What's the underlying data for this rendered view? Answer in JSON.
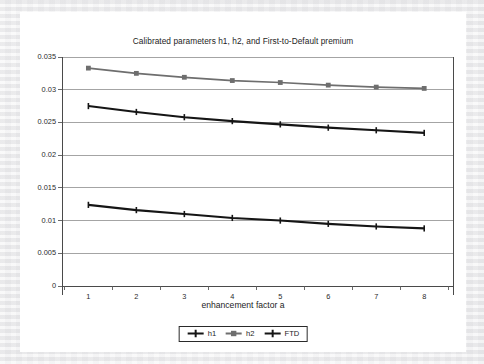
{
  "chart_data": {
    "type": "line",
    "title": "Calibrated parameters h1, h2, and First-to-Default premium",
    "xlabel": "enhancement factor a",
    "ylabel": "",
    "x": [
      1,
      2,
      3,
      4,
      5,
      6,
      7,
      8
    ],
    "xtick_labels": [
      "1",
      "2",
      "3",
      "4",
      "5",
      "6",
      "7",
      "8"
    ],
    "ytick_labels": [
      "0",
      "0.005",
      "0.01",
      "0.015",
      "0.02",
      "0.025",
      "0.03",
      "0.035"
    ],
    "ytick_values": [
      0,
      0.005,
      0.01,
      0.015,
      0.02,
      0.025,
      0.03,
      0.035
    ],
    "xlim": [
      0.45,
      8.6
    ],
    "ylim": [
      0,
      0.035
    ],
    "grid": true,
    "legend_position": "bottom-outside",
    "series": [
      {
        "name": "h1",
        "color": "#151515",
        "marker": "plus",
        "values": [
          0.0275,
          0.0266,
          0.0258,
          0.0252,
          0.0247,
          0.0242,
          0.0238,
          0.0234
        ]
      },
      {
        "name": "h2",
        "color": "#6e6e6e",
        "marker": "square",
        "values": [
          0.0333,
          0.0325,
          0.0319,
          0.0314,
          0.0311,
          0.0307,
          0.0304,
          0.0302
        ]
      },
      {
        "name": "FTD",
        "color": "#151515",
        "marker": "plus",
        "values": [
          0.0124,
          0.0116,
          0.011,
          0.0104,
          0.01,
          0.0095,
          0.0091,
          0.0088
        ]
      }
    ]
  },
  "legend": {
    "entries": [
      {
        "label": "h1"
      },
      {
        "label": "h2"
      },
      {
        "label": "FTD"
      }
    ]
  }
}
